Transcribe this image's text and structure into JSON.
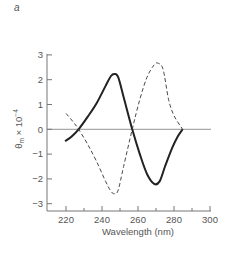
{
  "panel_label": "a",
  "chart_data": {
    "type": "line",
    "title": "",
    "xlabel": "Wavelength (nm)",
    "ylabel": "θm × 10⁻⁴",
    "xlim": [
      215,
      302
    ],
    "ylim": [
      -3,
      3
    ],
    "x_ticks": [
      220,
      240,
      260,
      280,
      300
    ],
    "x_minor_ticks": [
      230,
      250,
      270,
      290
    ],
    "y_ticks": [
      3,
      2,
      1,
      0,
      -1,
      -2,
      -3
    ],
    "grid": false,
    "zero_line": true,
    "legend": null,
    "series": [
      {
        "name": "solid",
        "style": "solid",
        "x": [
          219.5,
          223,
          227,
          232,
          237,
          242,
          245,
          247,
          249,
          252,
          256.8,
          261,
          265,
          269,
          272,
          275,
          279,
          282,
          284.8
        ],
        "y": [
          -0.48,
          -0.3,
          0.0,
          0.5,
          1.05,
          1.75,
          2.15,
          2.23,
          2.1,
          1.3,
          0.0,
          -1.0,
          -1.8,
          -2.2,
          -2.1,
          -1.5,
          -0.75,
          -0.3,
          0.0
        ]
      },
      {
        "name": "dashed",
        "style": "dashed",
        "x": [
          220,
          224,
          227,
          232,
          237,
          242,
          245,
          247,
          249,
          252,
          256.8,
          261,
          265,
          269,
          271.3,
          274,
          277,
          280,
          284.8
        ],
        "y": [
          0.64,
          0.3,
          0.0,
          -0.6,
          -1.3,
          -2.1,
          -2.5,
          -2.6,
          -2.45,
          -1.5,
          0.0,
          1.2,
          2.1,
          2.6,
          2.66,
          2.4,
          1.2,
          0.55,
          0.0
        ]
      }
    ]
  }
}
